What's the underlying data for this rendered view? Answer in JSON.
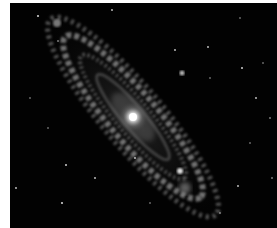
{
  "image": {
    "subject": "spiral galaxy",
    "background_color": "#020202",
    "core": {
      "x": 123,
      "y": 114
    },
    "tilt_deg": 50,
    "stars": [
      [
        28,
        13
      ],
      [
        102,
        7
      ],
      [
        120,
        2
      ],
      [
        165,
        47
      ],
      [
        182,
        15
      ],
      [
        198,
        44
      ],
      [
        232,
        65
      ],
      [
        246,
        95
      ],
      [
        260,
        115
      ],
      [
        48,
        38
      ],
      [
        253,
        60
      ],
      [
        56,
        162
      ],
      [
        85,
        175
      ],
      [
        52,
        200
      ],
      [
        6,
        185
      ],
      [
        125,
        155
      ],
      [
        228,
        183
      ],
      [
        210,
        210
      ],
      [
        140,
        200
      ],
      [
        170,
        215
      ],
      [
        262,
        175
      ],
      [
        20,
        95
      ],
      [
        38,
        125
      ],
      [
        240,
        140
      ],
      [
        200,
        75
      ]
    ]
  }
}
